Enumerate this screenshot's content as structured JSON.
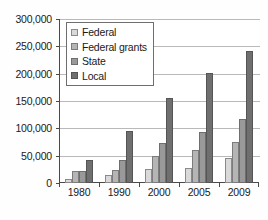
{
  "chart_data": {
    "type": "bar",
    "title": "",
    "subtitle": "",
    "xlabel": "",
    "ylabel": "",
    "categories": [
      "1980",
      "1990",
      "2000",
      "2005",
      "2009"
    ],
    "series": [
      {
        "name": "Federal",
        "color": "#d9d9d9",
        "values": [
          8000,
          14000,
          25000,
          27000,
          46000
        ]
      },
      {
        "name": "Federal grants",
        "color": "#b5b5b5",
        "values": [
          22000,
          24000,
          49000,
          61000,
          75000
        ]
      },
      {
        "name": "State",
        "color": "#999999",
        "values": [
          22000,
          43000,
          74000,
          94000,
          117000
        ]
      },
      {
        "name": "Local",
        "color": "#6f6f6f",
        "values": [
          43000,
          95000,
          155000,
          202000,
          242000
        ]
      }
    ],
    "ylim": [
      0,
      300000
    ],
    "ytick_values": [
      0,
      50000,
      100000,
      150000,
      200000,
      250000,
      300000
    ],
    "ytick_labels": [
      "0",
      "50,000",
      "100,000",
      "150,000",
      "200,000",
      "250,000",
      "300,000"
    ],
    "grid": true,
    "legend_position": "upper-left-inside",
    "legend_entries": [
      "Federal",
      "Federal grants",
      "State",
      "Local"
    ]
  }
}
